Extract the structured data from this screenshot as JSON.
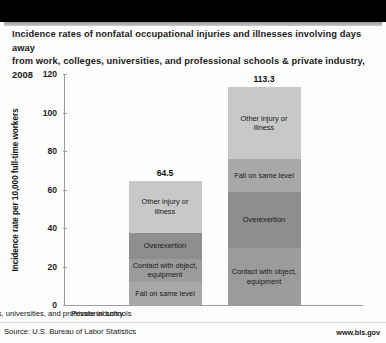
{
  "title": "Incidence rates of nonfatal occupational injuries and illnesses involving days away from work, colleges, universities, and professional schools & private industry, 2008",
  "title_line1": "Incidence rates of nonfatal occupational injuries and illnesses involving days away",
  "title_line2": "from work, colleges, universities, and professional schools & private industry, 2008",
  "footer": {
    "source": "Source: U.S. Bureau of Labor Statistics",
    "url": "www.bls.gov"
  },
  "colors": {
    "other_injury_or_illness": "#c8c8c8",
    "fall_on_same_level": "#a8a8a8",
    "overexertion": "#8e8e8e",
    "contact_with_object": "#9b9b9b",
    "axis": "#9d9d9d",
    "text": "#171717",
    "band": "#000000"
  },
  "chart_data": {
    "type": "bar",
    "stacked": true,
    "title": "Incidence rates of nonfatal occupational injuries and illnesses involving days away from work, colleges, universities, and professional schools & private industry, 2008",
    "xlabel": "",
    "ylabel": "Incidence rate per 10,000 full-time workers",
    "ylim": [
      0,
      120
    ],
    "yticks": [
      0,
      20,
      40,
      60,
      80,
      100,
      120
    ],
    "ytick_labels": [
      "0",
      "20",
      "40",
      "60",
      "80",
      "100",
      "120"
    ],
    "grid": false,
    "legend": "none (segments labeled in place)",
    "categories": [
      "Colleges, universities, and professional schools",
      "Private industry"
    ],
    "totals": [
      64.5,
      113.3
    ],
    "total_labels": [
      "64.5",
      "113.3"
    ],
    "series": [
      {
        "name": "Other injury or illness",
        "values": [
          27.0,
          37.4
        ],
        "color": "#c8c8c8"
      },
      {
        "name": "Fall on same level",
        "values": [
          12.0,
          17.1
        ],
        "color": "#a8a8a8"
      },
      {
        "name": "Overexertion",
        "values": [
          13.6,
          29.2
        ],
        "color": "#8e8e8e"
      },
      {
        "name": "Contact with object, equipment",
        "values": [
          11.9,
          29.6
        ],
        "color": "#9b9b9b"
      }
    ],
    "bars": [
      {
        "category": "Colleges, universities, and professional schools",
        "total": 64.5,
        "segments_bottom_to_top": [
          {
            "label": "Fall on same level",
            "value": 12.0
          },
          {
            "label": "Contact with object, equipment",
            "value": 11.9
          },
          {
            "label": "Overexertion",
            "value": 13.6
          },
          {
            "label": "Other injury or illness",
            "value": 27.0
          }
        ]
      },
      {
        "category": "Private industry",
        "total": 113.3,
        "segments_bottom_to_top": [
          {
            "label": "Contact with object, equipment",
            "value": 29.6
          },
          {
            "label": "Overexertion",
            "value": 29.2
          },
          {
            "label": "Fall on same level",
            "value": 17.1
          },
          {
            "label": "Other injury or illness",
            "value": 37.4
          }
        ]
      }
    ]
  }
}
